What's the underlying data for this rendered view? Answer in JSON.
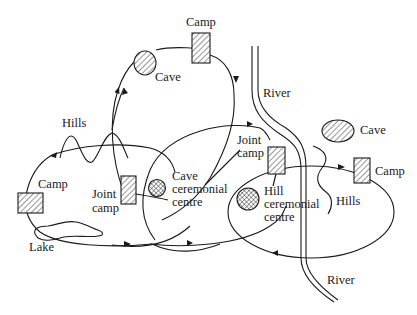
{
  "diagram": {
    "type": "seasonal-movement-map",
    "labels": {
      "camp_top": "Camp",
      "cave_top": "Cave",
      "hills_left": "Hills",
      "camp_left": "Camp",
      "joint_camp_left_1": "Joint",
      "joint_camp_left_2": "camp",
      "lake": "Lake",
      "cave_cer_1": "Cave",
      "cave_cer_2": "ceremonial",
      "cave_cer_3": "centre",
      "river_top": "River",
      "river_bottom": "River",
      "joint_camp_right_1": "Joint",
      "joint_camp_right_2": "camp",
      "cave_right": "Cave",
      "camp_right": "Camp",
      "hills_right": "Hills",
      "hill_cer_1": "Hill",
      "hill_cer_2": "ceremonial",
      "hill_cer_3": "centre"
    },
    "nodes": [
      {
        "id": "camp-top",
        "kind": "camp",
        "label": "Camp"
      },
      {
        "id": "cave-top",
        "kind": "cave",
        "label": "Cave"
      },
      {
        "id": "camp-left",
        "kind": "camp",
        "label": "Camp"
      },
      {
        "id": "joint-camp-left",
        "kind": "joint-camp",
        "label": "Joint camp"
      },
      {
        "id": "cave-ceremonial-centre",
        "kind": "ceremonial-centre",
        "label": "Cave ceremonial centre"
      },
      {
        "id": "joint-camp-right",
        "kind": "joint-camp",
        "label": "Joint camp"
      },
      {
        "id": "hill-ceremonial-centre",
        "kind": "ceremonial-centre",
        "label": "Hill ceremonial centre"
      },
      {
        "id": "camp-right",
        "kind": "camp",
        "label": "Camp"
      },
      {
        "id": "cave-right",
        "kind": "cave",
        "label": "Cave"
      }
    ],
    "features": [
      {
        "id": "hills-left",
        "label": "Hills"
      },
      {
        "id": "hills-right",
        "label": "Hills"
      },
      {
        "id": "lake",
        "label": "Lake"
      },
      {
        "id": "river",
        "label": "River"
      }
    ],
    "colors": {
      "ink": "#1a1a1a",
      "background": "#ffffff"
    }
  }
}
